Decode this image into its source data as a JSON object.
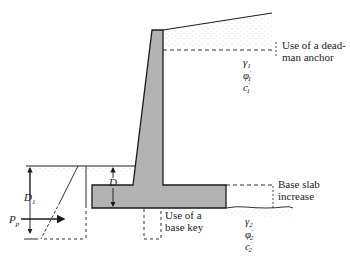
{
  "diagram": {
    "type": "cantilever-retaining-wall",
    "colors": {
      "concrete": "#b3b3b3",
      "line": "#1a1a1a",
      "soil_dots": "#c8c8c8"
    },
    "labels": {
      "deadman_1": "Use of a dead-",
      "deadman_2": "man anchor",
      "base_slab_1": "Base slab",
      "base_slab_2": "increase",
      "base_key_1": "Use of a",
      "base_key_2": "base key",
      "D": "D",
      "D1": "D",
      "D1_sub": "1",
      "Pp": "P",
      "Pp_sub": "p"
    },
    "soil_layer_1": {
      "gamma": "γ",
      "gamma_sub": "1",
      "phi": "φ",
      "phi_sub": "1",
      "c": "c",
      "c_sub": "1",
      "prime": "′"
    },
    "soil_layer_2": {
      "gamma": "γ",
      "gamma_sub": "2",
      "phi": "φ",
      "phi_sub": "2",
      "c": "c",
      "c_sub": "2",
      "prime": "′"
    }
  }
}
